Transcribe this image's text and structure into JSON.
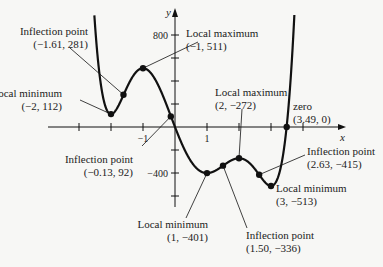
{
  "chart_data": {
    "type": "line",
    "title": "",
    "xlabel": "x",
    "ylabel": "y",
    "function": "f(x) = 10x^6 - 36x^5 - 75x^4 + 300x^3 + 120x^2 - 720x",
    "xlim": [
      -3,
      4
    ],
    "ylim": [
      -600,
      800
    ],
    "x_ticks": [
      -3,
      -2,
      -1,
      1,
      2,
      3,
      4
    ],
    "x_tick_labels": [
      {
        "value": -1,
        "text": "−1"
      },
      {
        "value": 1,
        "text": "1"
      }
    ],
    "y_ticks": [
      -600,
      -400,
      -200,
      200,
      400,
      600,
      800
    ],
    "y_tick_labels": [
      {
        "value": 800,
        "text": "800"
      },
      {
        "value": -400,
        "text": "−400"
      }
    ],
    "grid": false,
    "color": "#111111",
    "annotations": [
      {
        "x": -1.61,
        "y": 281,
        "label": "Inflection point",
        "coords": "(−1.61, 281)"
      },
      {
        "x": -1,
        "y": 511,
        "label": "Local maximum",
        "coords": "(−1, 511)"
      },
      {
        "x": -2,
        "y": 112,
        "label": "Local minimum",
        "coords": "(−2, 112)"
      },
      {
        "x": 2,
        "y": -272,
        "label": "Local maximum",
        "coords": "(2, −272)"
      },
      {
        "x": 3.49,
        "y": 0,
        "label": "zero",
        "coords": "(3.49, 0)"
      },
      {
        "x": -0.13,
        "y": 92,
        "label": "Inflection point",
        "coords": "(−0.13, 92)"
      },
      {
        "x": 2.63,
        "y": -415,
        "label": "Inflection point",
        "coords": "(2.63, −415)"
      },
      {
        "x": 3,
        "y": -513,
        "label": "Local minimum",
        "coords": "(3, −513)"
      },
      {
        "x": 1,
        "y": -401,
        "label": "Local minimum",
        "coords": "(1, −401)"
      },
      {
        "x": 1.5,
        "y": -336,
        "label": "Inflection point",
        "coords": "(1.50, −336)"
      }
    ]
  }
}
